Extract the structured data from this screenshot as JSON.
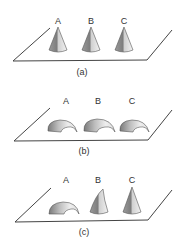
{
  "figure": {
    "panels": [
      {
        "caption": "(a)",
        "objects": [
          {
            "label": "A",
            "shape": "cone"
          },
          {
            "label": "B",
            "shape": "cone"
          },
          {
            "label": "C",
            "shape": "cone"
          }
        ]
      },
      {
        "caption": "(b)",
        "objects": [
          {
            "label": "A",
            "shape": "hook"
          },
          {
            "label": "B",
            "shape": "hook"
          },
          {
            "label": "C",
            "shape": "hook"
          }
        ]
      },
      {
        "caption": "(c)",
        "objects": [
          {
            "label": "A",
            "shape": "hook"
          },
          {
            "label": "B",
            "shape": "bent-cone"
          },
          {
            "label": "C",
            "shape": "cone"
          }
        ]
      }
    ],
    "colors": {
      "line": "#444444",
      "shade_dark": "#8a8a8a",
      "shade_light": "#e6e6e6"
    }
  }
}
